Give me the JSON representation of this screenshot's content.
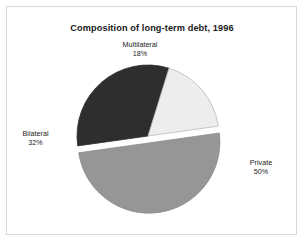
{
  "figure": {
    "title": "Composition of long-term debt, 1996",
    "background_color": "#ffffff",
    "border_color": "#d8d8d8"
  },
  "chart_data": {
    "type": "pie",
    "title": "Composition of long-term debt, 1996",
    "xlabel": "",
    "ylabel": "",
    "units": "percent",
    "total": 100,
    "legend_position": "none",
    "grid": false,
    "start_angle_deg": -8,
    "direction": "clockwise",
    "center": {
      "x": 148,
      "y": 136
    },
    "radius": 71,
    "categories": [
      "Private",
      "Bilateral",
      "Multilateral"
    ],
    "values": [
      50,
      32,
      18
    ],
    "slices": [
      {
        "label": "Private",
        "value": 50,
        "value_text": "50%",
        "color": "#969696",
        "edge_color": "#8a8a8a",
        "exploded": true,
        "explode_offset": 7,
        "label_position": "right"
      },
      {
        "label": "Bilateral",
        "value": 32,
        "value_text": "32%",
        "color": "#2e2e2e",
        "edge_color": "#2e2e2e",
        "exploded": false,
        "explode_offset": 0,
        "label_position": "left"
      },
      {
        "label": "Multilateral",
        "value": 18,
        "value_text": "18%",
        "color": "#ededed",
        "edge_color": "#b9b9b9",
        "exploded": false,
        "explode_offset": 0,
        "label_position": "top"
      }
    ]
  },
  "labels": {
    "multilateral": {
      "name": "Multilateral",
      "value": "18%"
    },
    "bilateral": {
      "name": "Bilateral",
      "value": "32%"
    },
    "private": {
      "name": "Private",
      "value": "50%"
    }
  }
}
